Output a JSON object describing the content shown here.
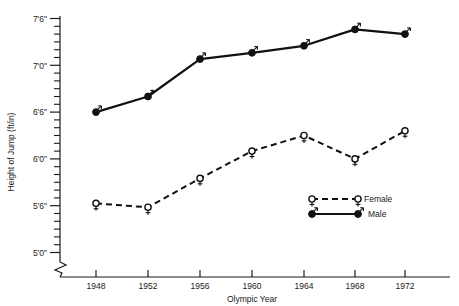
{
  "chart_data": {
    "type": "line",
    "title": "",
    "xlabel": "Olympic Year",
    "ylabel": "Height of Jump (ft/in)",
    "x": [
      1948,
      1952,
      1956,
      1960,
      1964,
      1968,
      1972
    ],
    "xtick_labels": [
      "1948",
      "1952",
      "1956",
      "1960",
      "1964",
      "1968",
      "1972"
    ],
    "xlim": [
      1946,
      1974
    ],
    "ylim_inches": [
      60,
      90
    ],
    "ytick_labels": [
      "5'0\"",
      "5'6\"",
      "6'0\"",
      "6'6\"",
      "7'0\"",
      "7'6\""
    ],
    "ytick_values_inches": [
      60,
      66,
      72,
      78,
      84,
      90
    ],
    "minor_tick_interval_inches": 1,
    "axis_break": true,
    "grid": false,
    "legend_position": "inside-lower-right",
    "series": [
      {
        "name": "Female",
        "marker": "open-venus-circle",
        "linestyle": "dashed",
        "values_inches": [
          66.3,
          65.8,
          69.5,
          73.0,
          75.0,
          72.0,
          75.6
        ],
        "values_ftin": [
          "5'6.3\"",
          "5'5.8\"",
          "5'9.5\"",
          "6'1.0\"",
          "6'3.0\"",
          "6'0.0\"",
          "6'3.6\""
        ]
      },
      {
        "name": "Male",
        "marker": "filled-mars-circle",
        "linestyle": "solid",
        "values_inches": [
          78.0,
          80.0,
          84.8,
          85.6,
          86.5,
          88.6,
          88.0
        ],
        "values_ftin": [
          "6'6.0\"",
          "6'8.0\"",
          "7'0.8\"",
          "7'1.6\"",
          "7'2.5\"",
          "7'4.6\"",
          "7'4.0\""
        ]
      }
    ]
  },
  "legend": {
    "entries": [
      {
        "label": "Female"
      },
      {
        "label": "Male"
      }
    ]
  },
  "axes": {
    "y_title": "Height of Jump (ft/in)",
    "x_title": "Olympic Year"
  }
}
